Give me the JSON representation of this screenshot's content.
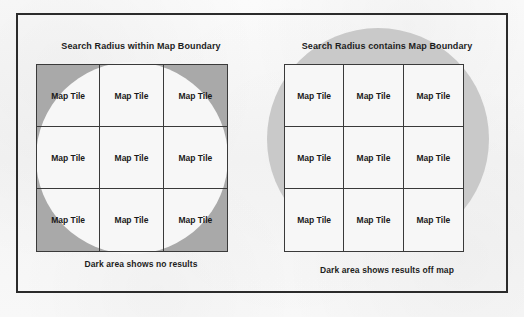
{
  "figure": {
    "background_color": "#f6f6f6",
    "frame_border_color": "#2b2b2b",
    "panels": [
      {
        "id": "search-radius-within-map-boundary",
        "title": "Search Radius within Map Boundary",
        "caption": "Dark area shows no results",
        "shade_color": "#a9a9a9",
        "circle_color": "#f7f7f7",
        "grid": {
          "rows": 3,
          "columns": 3,
          "tiles": [
            "Map Tile",
            "Map Tile",
            "Map Tile",
            "Map Tile",
            "Map Tile",
            "Map Tile",
            "Map Tile",
            "Map Tile",
            "Map Tile"
          ]
        }
      },
      {
        "id": "search-radius-contains-map-boundary",
        "title": "Search Radius contains Map Boundary",
        "caption": "Dark area shows results off map",
        "shade_color": "#c9c9c9",
        "circle_color": "#c9c9c9",
        "grid": {
          "rows": 3,
          "columns": 3,
          "tiles": [
            "Map Tile",
            "Map Tile",
            "Map Tile",
            "Map Tile",
            "Map Tile",
            "Map Tile",
            "Map Tile",
            "Map Tile",
            "Map Tile"
          ]
        }
      }
    ]
  }
}
